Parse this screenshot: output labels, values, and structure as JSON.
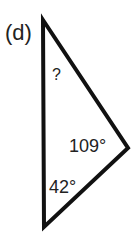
{
  "figure": {
    "label": "(d)",
    "unknown_angle": "?",
    "angles": [
      {
        "vertex": "right",
        "value": "109°"
      },
      {
        "vertex": "bottom",
        "value": "42°"
      }
    ],
    "colors": {
      "stroke": "#111111",
      "text": "#222222",
      "background": "#ffffff"
    }
  }
}
